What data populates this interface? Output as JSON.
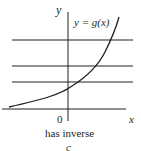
{
  "diagram": {
    "axis_x_label": "x",
    "axis_y_label": "y",
    "origin_label": "0",
    "curve_label": "y = g(x)",
    "caption": "has inverse",
    "panel_letter": "c",
    "horizontal_lines": 3,
    "colors": {
      "ink": "#231f20",
      "background": "#ffffff"
    }
  }
}
